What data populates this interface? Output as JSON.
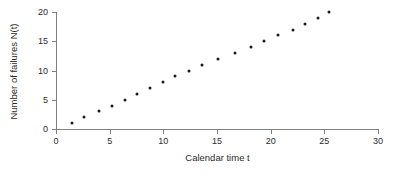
{
  "chart_data": {
    "type": "scatter",
    "title": "",
    "xlabel": "Calendar time t",
    "ylabel": "Number of failures N(t)",
    "xlim": [
      0,
      30
    ],
    "ylim": [
      0,
      20
    ],
    "xticks": [
      0,
      5,
      10,
      15,
      20,
      25,
      30
    ],
    "yticks": [
      0,
      5,
      10,
      15,
      20
    ],
    "grid": false,
    "legend": null,
    "marker": "filled-circle",
    "marker_color": "#1a1a1a",
    "axis_color": "#808080",
    "series": [
      {
        "name": "Cumulative failures",
        "x": [
          1.5,
          2.6,
          4.0,
          5.2,
          6.4,
          7.5,
          8.8,
          10.0,
          11.1,
          12.4,
          13.6,
          15.1,
          16.7,
          18.2,
          19.4,
          20.7,
          22.1,
          23.2,
          24.4,
          25.4
        ],
        "y": [
          1,
          2,
          3,
          4,
          5,
          6,
          7,
          8,
          9,
          10,
          11,
          12,
          13,
          14,
          15,
          16,
          17,
          18,
          19,
          20
        ]
      }
    ]
  }
}
